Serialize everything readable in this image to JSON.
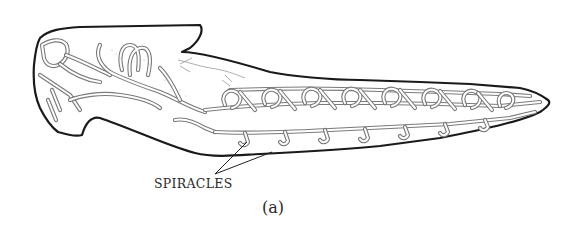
{
  "figure": {
    "panel_label": "(a)",
    "labels": [
      {
        "id": "spiracles",
        "text": "SPIRACLES"
      }
    ],
    "colors": {
      "outline": "#1a1a1a",
      "trachea": "#7a7a7a",
      "background": "#ffffff"
    }
  }
}
